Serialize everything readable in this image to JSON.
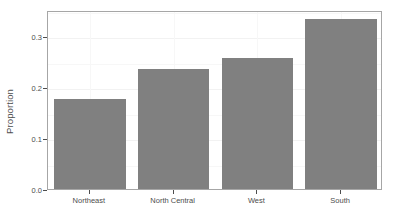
{
  "chart_data": {
    "type": "bar",
    "title": "",
    "subtitle": "",
    "xlabel": "",
    "ylabel": "Proportion",
    "categories": [
      "Northeast",
      "North Central",
      "West",
      "South"
    ],
    "values": [
      0.176,
      0.236,
      0.256,
      0.333
    ],
    "ylim": [
      0.0,
      0.351
    ],
    "ytick_labels": [
      "0.0",
      "0.1",
      "0.2",
      "0.3"
    ],
    "ytick_values": [
      0.0,
      0.1,
      0.2,
      0.3
    ],
    "grid": true,
    "legend": "none",
    "bar_color": "#808080",
    "panel_background": "#ffffff",
    "panel_border_color": "#a6a6a6",
    "axis_text_color": "#4d4d4d",
    "gridline_color": "#f2f2f2"
  }
}
